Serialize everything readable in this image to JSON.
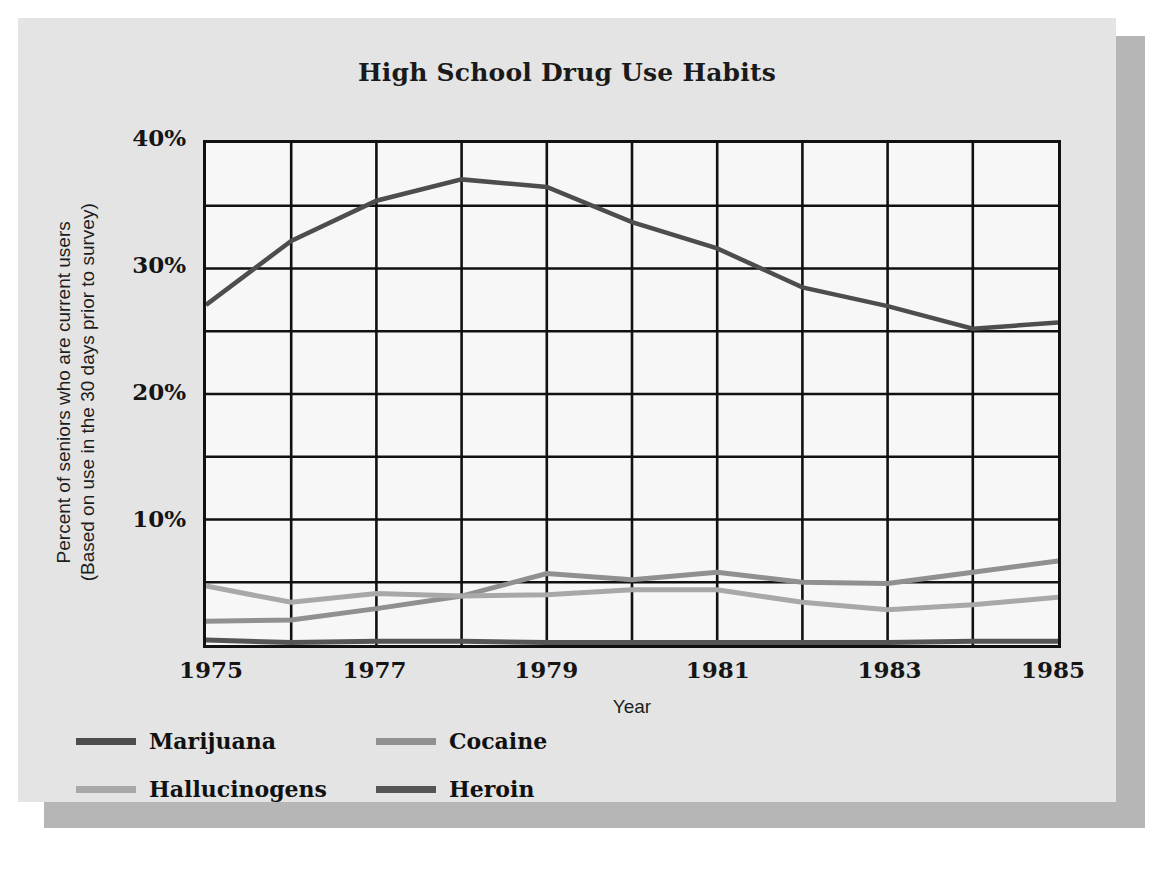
{
  "chart_data": {
    "type": "line",
    "title": "High School Drug Use Habits",
    "xlabel": "Year",
    "ylabel": "Percent of seniors who are current users (Based on use in the 30 days prior to survey)",
    "ylabel_line1": "Percent of seniors who are current users",
    "ylabel_line2": "(Based on use in the 30 days prior to survey)",
    "x": [
      1975,
      1976,
      1977,
      1978,
      1979,
      1980,
      1981,
      1982,
      1983,
      1984,
      1985
    ],
    "xlim": [
      1975,
      1985
    ],
    "ylim": [
      0,
      40
    ],
    "x_tick_labels": [
      "1975",
      "1977",
      "1979",
      "1981",
      "1983",
      "1985"
    ],
    "x_tick_values": [
      1975,
      1977,
      1979,
      1981,
      1983,
      1985
    ],
    "y_tick_labels": [
      "40%",
      "30%",
      "20%",
      "10%"
    ],
    "y_tick_values": [
      40,
      30,
      20,
      10
    ],
    "y_gridline_values": [
      5,
      10,
      15,
      20,
      25,
      30,
      35
    ],
    "x_gridline_values": [
      1976,
      1977,
      1978,
      1979,
      1980,
      1981,
      1982,
      1983,
      1984
    ],
    "grid": true,
    "legend_position": "bottom-left",
    "series": [
      {
        "name": "Marijuana",
        "color": "#4d4d4d",
        "width": 4.5,
        "values": [
          27.1,
          32.2,
          35.4,
          37.1,
          36.5,
          33.7,
          31.6,
          28.5,
          27.0,
          25.2,
          25.7
        ]
      },
      {
        "name": "Cocaine",
        "color": "#909090",
        "width": 5,
        "values": [
          1.9,
          2.0,
          2.9,
          3.9,
          5.7,
          5.2,
          5.8,
          5.0,
          4.9,
          5.8,
          6.7
        ]
      },
      {
        "name": "Hallucinogens",
        "color": "#a8a8a8",
        "width": 5,
        "values": [
          4.7,
          3.4,
          4.1,
          3.9,
          4.0,
          4.4,
          4.4,
          3.4,
          2.8,
          3.2,
          3.8
        ]
      },
      {
        "name": "Heroin",
        "color": "#555555",
        "width": 5,
        "values": [
          0.4,
          0.2,
          0.3,
          0.3,
          0.2,
          0.2,
          0.2,
          0.2,
          0.2,
          0.3,
          0.3
        ]
      }
    ]
  },
  "legend": {
    "items": [
      {
        "label": "Marijuana",
        "color": "#4d4d4d"
      },
      {
        "label": "Cocaine",
        "color": "#909090"
      },
      {
        "label": "Hallucinogens",
        "color": "#a8a8a8"
      },
      {
        "label": "Heroin",
        "color": "#555555"
      }
    ]
  },
  "style": {
    "page_background": "#ffffff",
    "card_background": "#e4e4e4",
    "shadow_color": "#b6b6b6",
    "plot_background": "#f7f7f7",
    "axis_color": "#111111",
    "text_color": "#151515"
  }
}
